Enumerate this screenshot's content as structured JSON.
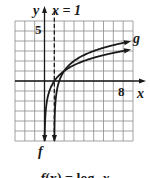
{
  "chart_data": {
    "type": "line",
    "title": "",
    "xlabel": "x",
    "ylabel": "y",
    "xlim": [
      -3,
      9
    ],
    "ylim": [
      -6,
      6
    ],
    "grid": true,
    "tick_labels": {
      "x": [
        "8"
      ],
      "y": [
        "5"
      ]
    },
    "annotations": [
      {
        "text": "x = 1",
        "type": "vertical-asymptote",
        "x": 1,
        "style": "dashed"
      }
    ],
    "series": [
      {
        "name": "f",
        "function": "log2(x)",
        "asymptote_x": 0,
        "x": [
          0.02,
          0.05,
          0.1,
          0.25,
          0.5,
          1,
          2,
          4,
          8,
          8.5
        ],
        "values": [
          -5.64,
          -4.32,
          -3.32,
          -2,
          -1,
          0,
          1,
          2,
          3,
          3.09
        ]
      },
      {
        "name": "g",
        "function": "log2(x - 1) + 1",
        "asymptote_x": 1,
        "x": [
          1.02,
          1.05,
          1.1,
          1.25,
          1.5,
          2,
          3,
          5,
          8.5
        ],
        "values": [
          -4.64,
          -3.32,
          -2.32,
          -1,
          0,
          1,
          2,
          3,
          3.91
        ]
      }
    ],
    "legend": "inline labels (f at bottom of f's asymptote arrow, g at right end of g)",
    "caption": "f(x) = log2 x"
  },
  "labels": {
    "y_axis": "y",
    "x_axis": "x",
    "asymptote": "x = 1",
    "tick_y5": "5",
    "tick_x8": "8",
    "curve_f": "f",
    "curve_g": "g"
  },
  "caption": {
    "func": "f",
    "lhs_rest": "(x) = log",
    "base": "2",
    "var": " x"
  },
  "colors": {
    "ink": "#1a1a1a",
    "grid": "#8a8a8a",
    "background": "#ffffff"
  }
}
